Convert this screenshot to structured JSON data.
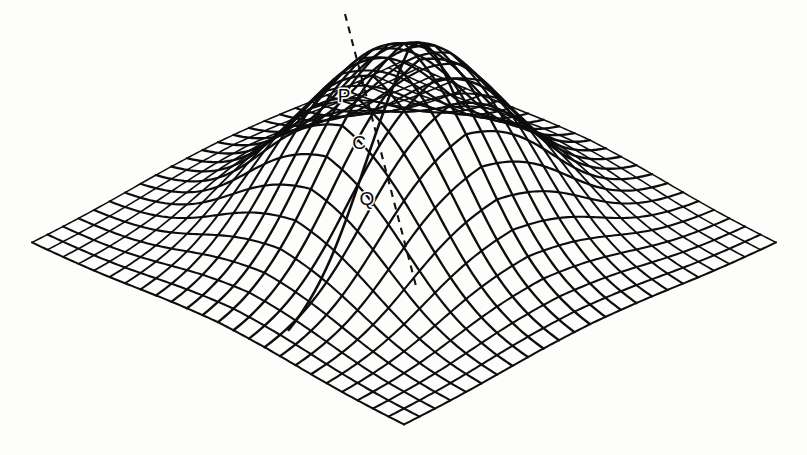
{
  "figure": {
    "kind": "3d-wireframe-surface",
    "background_color": "#fdfdfc",
    "line_color": "#0d0d0d",
    "label_color": "#0b0b0b"
  },
  "chart_data": {
    "type": "line",
    "title": "",
    "xlabel": "",
    "ylabel": "",
    "grid": true,
    "legend_position": "none",
    "surface": {
      "plateau_height": 1.0,
      "base_height": 0.0,
      "u_range": [
        -1.0,
        1.0
      ],
      "v_range": [
        -1.0,
        1.0
      ],
      "plateau_half_width_u": 0.44,
      "plateau_half_width_v": 0.4,
      "edge_sharpness": 9.0,
      "grid_lines_u": 24,
      "grid_lines_v": 24
    },
    "projection": {
      "origin_x": 404,
      "origin_y": 243,
      "u_axis_px": [
        -186,
        91
      ],
      "v_axis_px": [
        186,
        91
      ],
      "z_axis_px": [
        0,
        -228
      ]
    },
    "annotations": [
      {
        "label": "P",
        "x": 344,
        "y": 97,
        "marker_x": 367,
        "marker_y": 95,
        "note": "upper marked point on near slope"
      },
      {
        "label": "C",
        "x": 359,
        "y": 144,
        "marker_x": 377,
        "marker_y": 145,
        "note": "middle marked point on near slope"
      },
      {
        "label": "Q",
        "x": 367,
        "y": 200,
        "marker_x": 391,
        "marker_y": 199,
        "note": "lower marked point on near slope"
      }
    ],
    "chord": {
      "style": "dashed",
      "start": [
        345,
        14
      ],
      "end": [
        416,
        286
      ],
      "dash_pattern": "7 6",
      "passes_through": [
        "P",
        "C",
        "Q"
      ]
    },
    "geodesic": {
      "style": "solid",
      "note": "curve lying in the surface through P, C, Q"
    }
  },
  "labels": {
    "p": "P",
    "c": "C",
    "q": "Q"
  }
}
